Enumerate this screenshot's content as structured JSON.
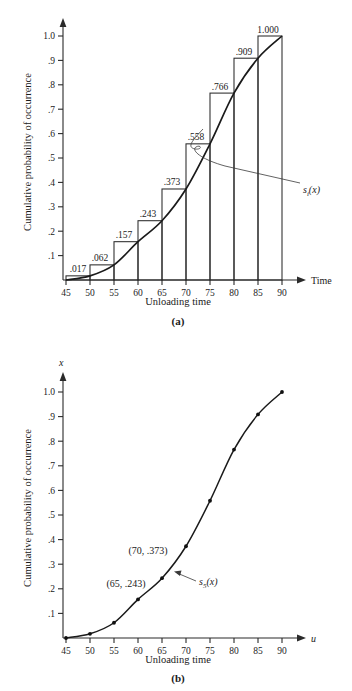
{
  "figure": {
    "panels": [
      {
        "id": "a",
        "panel_label": "(a)",
        "y_axis_label": "Cumulative probability of occurrence",
        "x_axis_title": "Unloading time",
        "x_axis_name": "Time",
        "y_axis_name": ""
      },
      {
        "id": "b",
        "panel_label": "(b)",
        "y_axis_label": "Cumulative probability of occurrence",
        "x_axis_title": "Unloading time",
        "x_axis_name": "u",
        "y_axis_name": "x"
      }
    ]
  },
  "chart_data": [
    {
      "type": "bar",
      "title": "",
      "subtitle": "(a)",
      "xlabel": "Unloading time",
      "ylabel": "Cumulative probability of occurrence",
      "x_axis_name": "Time",
      "xlim": [
        45,
        90
      ],
      "ylim": [
        0,
        1.05
      ],
      "grid": false,
      "legend": "none",
      "x_ticks": [
        45,
        50,
        55,
        60,
        65,
        70,
        75,
        80,
        85,
        90
      ],
      "x_tick_labels": [
        "45",
        "50",
        "55",
        "60",
        "65",
        "70",
        "75",
        "80",
        "85",
        "90"
      ],
      "y_ticks": [
        0.1,
        0.2,
        0.3,
        0.4,
        0.5,
        0.6,
        0.7,
        0.8,
        0.9,
        1.0
      ],
      "y_tick_labels": [
        ".1",
        ".2",
        ".3",
        ".4",
        ".5",
        ".6",
        ".7",
        ".8",
        ".9",
        "1.0"
      ],
      "categories": [
        "45-50",
        "50-55",
        "55-60",
        "60-65",
        "65-70",
        "70-75",
        "75-80",
        "80-85",
        "85-90"
      ],
      "values": [
        0.017,
        0.062,
        0.157,
        0.243,
        0.373,
        0.558,
        0.766,
        0.909,
        1.0
      ],
      "bar_labels": [
        ".017",
        ".062",
        ".157",
        ".243",
        ".373",
        ".558",
        ".766",
        ".909",
        "1.000"
      ],
      "annotations": [
        {
          "text": "s_i(x)",
          "display": "s",
          "sub": "i",
          "tail": "(x)"
        }
      ],
      "overlay_curve": {
        "name": "s_i(x)",
        "x": [
          45,
          50,
          55,
          60,
          65,
          70,
          75,
          80,
          85,
          90
        ],
        "y": [
          0,
          0.017,
          0.062,
          0.157,
          0.243,
          0.373,
          0.558,
          0.766,
          0.909,
          1.0
        ]
      }
    },
    {
      "type": "line",
      "title": "",
      "subtitle": "(b)",
      "xlabel": "Unloading time",
      "ylabel": "Cumulative probability of occurrence",
      "x_axis_name": "u",
      "y_axis_name": "x",
      "xlim": [
        45,
        90
      ],
      "ylim": [
        0,
        1.05
      ],
      "grid": false,
      "legend": "none",
      "x_ticks": [
        45,
        50,
        55,
        60,
        65,
        70,
        75,
        80,
        85,
        90
      ],
      "x_tick_labels": [
        "45",
        "50",
        "55",
        "60",
        "65",
        "70",
        "75",
        "80",
        "85",
        "90"
      ],
      "y_ticks": [
        0.1,
        0.2,
        0.3,
        0.4,
        0.5,
        0.6,
        0.7,
        0.8,
        0.9,
        1.0
      ],
      "y_tick_labels": [
        ".1",
        ".2",
        ".3",
        ".4",
        ".5",
        ".6",
        ".7",
        ".8",
        ".9",
        "1.0"
      ],
      "series": [
        {
          "name": "s_5(x)",
          "x": [
            45,
            50,
            55,
            60,
            65,
            70,
            75,
            80,
            85,
            90
          ],
          "y": [
            0,
            0.017,
            0.062,
            0.157,
            0.243,
            0.373,
            0.558,
            0.766,
            0.909,
            1.0
          ]
        }
      ],
      "point_annotations": [
        {
          "text": "(70, .373)",
          "x": 70,
          "y": 0.373
        },
        {
          "text": "(65, .243)",
          "x": 65,
          "y": 0.243
        }
      ],
      "annotations": [
        {
          "text": "s_5(x)",
          "display": "s",
          "sub": "5",
          "tail": "(x)"
        }
      ]
    }
  ],
  "labels": {
    "a": {
      "curve_label_main": "s",
      "curve_label_sub": "i",
      "curve_label_tail": "(x)",
      "panel": "(a)",
      "xname": "Time",
      "xtitle": "Unloading time",
      "ytitle": "Cumulative probability of occurrence",
      "bar_labels": [
        ".017",
        ".062",
        ".157",
        ".243",
        ".373",
        ".558",
        ".766",
        ".909",
        "1.000"
      ],
      "ytick_labels": [
        ".1",
        ".2",
        ".3",
        ".4",
        ".5",
        ".6",
        ".7",
        ".8",
        ".9",
        "1.0"
      ],
      "xtick_labels": [
        "45",
        "50",
        "55",
        "60",
        "65",
        "70",
        "75",
        "80",
        "85",
        "90"
      ]
    },
    "b": {
      "curve_label_main": "s",
      "curve_label_sub": "5",
      "curve_label_tail": "(x)",
      "panel": "(b)",
      "xname": "u",
      "yname": "x",
      "xtitle": "Unloading time",
      "ytitle": "Cumulative probability of occurrence",
      "ann1": "(70, .373)",
      "ann2": "(65, .243)",
      "ytick_labels": [
        ".1",
        ".2",
        ".3",
        ".4",
        ".5",
        ".6",
        ".7",
        ".8",
        ".9",
        "1.0"
      ],
      "xtick_labels": [
        "45",
        "50",
        "55",
        "60",
        "65",
        "70",
        "75",
        "80",
        "85",
        "90"
      ]
    }
  },
  "colors": {
    "ink": "#1a1a1a",
    "axis": "#2a2a2a",
    "background": "#ffffff"
  }
}
